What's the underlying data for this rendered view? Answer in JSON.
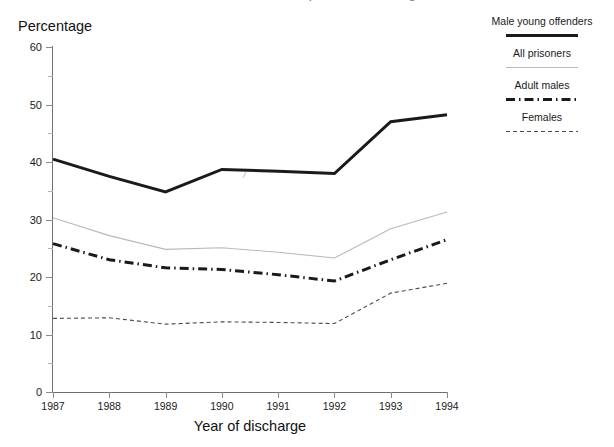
{
  "header": {
    "title": "Reconviction rates of prisoners discharged",
    "title_visible_fragment": "Reconviction rates of prisoners"
  },
  "axes": {
    "y_title": "Percentage",
    "x_title": "Year of discharge",
    "y_ticks": [
      "0",
      "10",
      "20",
      "30",
      "40",
      "50",
      "60"
    ],
    "y_minor_ticks": [
      "5",
      "15",
      "25",
      "35",
      "45",
      "55"
    ],
    "x_ticks": [
      "1987",
      "1988",
      "1989",
      "1990",
      "1991",
      "1992",
      "1993",
      "1994"
    ]
  },
  "legend": {
    "position": "right",
    "entries": [
      {
        "label": "Male young offenders",
        "style": "thick-solid",
        "color": "#1a1a1a"
      },
      {
        "label": "All prisoners",
        "style": "thin-solid",
        "color": "#b9b9b9"
      },
      {
        "label": "Adult males",
        "style": "dash-dot-bold",
        "color": "#1a1a1a"
      },
      {
        "label": "Females",
        "style": "fine-dotted",
        "color": "#4a4a4a"
      }
    ]
  },
  "artifacts": {
    "stray_mark": "/"
  },
  "chart_data": {
    "type": "line",
    "title": "Reconviction rates of prisoners discharged",
    "xlabel": "Year of discharge",
    "ylabel": "Percentage",
    "x": [
      1987,
      1988,
      1989,
      1990,
      1991,
      1992,
      1993,
      1994
    ],
    "xlim": [
      1987,
      1994
    ],
    "ylim": [
      0,
      60
    ],
    "grid": false,
    "legend_position": "right",
    "series": [
      {
        "name": "Male young offenders",
        "style": "thick-solid",
        "color": "#1a1a1a",
        "values": [
          40.5,
          37.5,
          34.8,
          38.7,
          38.4,
          38.0,
          47.0,
          48.2
        ]
      },
      {
        "name": "All prisoners",
        "style": "thin-solid",
        "color": "#b9b9b9",
        "values": [
          30.3,
          27.2,
          24.8,
          25.1,
          24.3,
          23.3,
          28.4,
          31.3
        ]
      },
      {
        "name": "Adult males",
        "style": "dash-dot-bold",
        "color": "#1a1a1a",
        "values": [
          25.8,
          23.0,
          21.6,
          21.3,
          20.4,
          19.3,
          23.0,
          26.5
        ]
      },
      {
        "name": "Females",
        "style": "fine-dotted",
        "color": "#4a4a4a",
        "values": [
          12.8,
          12.9,
          11.8,
          12.2,
          12.1,
          11.9,
          17.2,
          18.9
        ]
      }
    ]
  }
}
